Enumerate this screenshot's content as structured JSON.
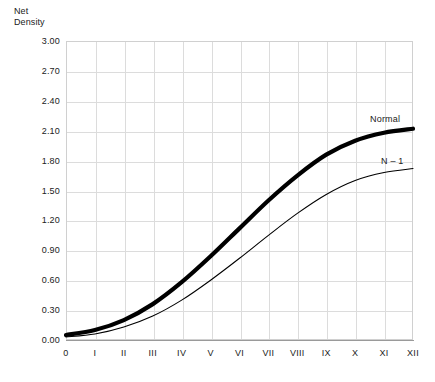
{
  "chart_data": {
    "type": "line",
    "title": "Net Density",
    "xlabel": "",
    "ylabel": "Net Density",
    "ylim": [
      0.0,
      3.0
    ],
    "ytick_step": 0.3,
    "grid": true,
    "legend_position": "inline-right",
    "categories": [
      "0",
      "I",
      "II",
      "III",
      "IV",
      "V",
      "VI",
      "VII",
      "VIII",
      "IX",
      "X",
      "XI",
      "XII"
    ],
    "x": [
      0,
      1,
      2,
      3,
      4,
      5,
      6,
      7,
      8,
      9,
      10,
      11,
      12
    ],
    "ytick_labels": [
      "3.00",
      "2.70",
      "2.40",
      "2.10",
      "1.80",
      "1.50",
      "1.20",
      "0.90",
      "0.60",
      "0.30",
      "0.00"
    ],
    "ytick_values": [
      3.0,
      2.7,
      2.4,
      2.1,
      1.8,
      1.5,
      1.2,
      0.9,
      0.6,
      0.3,
      0.0
    ],
    "series": [
      {
        "name": "Normal",
        "style": "thick",
        "color": "#000000",
        "width": 4.2,
        "values": [
          0.05,
          0.1,
          0.2,
          0.36,
          0.58,
          0.84,
          1.12,
          1.4,
          1.65,
          1.86,
          2.0,
          2.08,
          2.12
        ]
      },
      {
        "name": "N – 1",
        "style": "thin",
        "color": "#000000",
        "width": 1.1,
        "values": [
          0.03,
          0.06,
          0.13,
          0.24,
          0.4,
          0.6,
          0.82,
          1.05,
          1.27,
          1.46,
          1.6,
          1.68,
          1.72
        ]
      }
    ],
    "annotations": [
      {
        "text": "Normal",
        "series": "Normal"
      },
      {
        "text": "N – 1",
        "series": "N – 1"
      }
    ]
  },
  "colors": {
    "grid": "#dcdcdc",
    "frame": "#d0d0d0",
    "axis": "#9a9a9a",
    "text": "#1a1a1a",
    "curve": "#000000",
    "background": "#ffffff"
  }
}
